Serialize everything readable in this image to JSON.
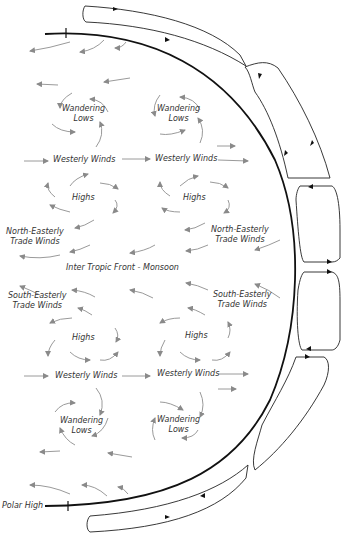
{
  "diagram": {
    "type": "global-atmospheric-circulation",
    "labels": {
      "wandering_lows_nw": "Wandering\nLows",
      "wandering_lows_ne": "Wandering\nLows",
      "westerly_winds_n1": "Westerly Winds",
      "westerly_winds_n2": "Westerly Winds",
      "highs_nw": "Highs",
      "highs_ne": "Highs",
      "ne_trade_winds_left": "North-Easterly\nTrade Winds",
      "ne_trade_winds_right": "North-Easterly\nTrade Winds",
      "itcz": "Inter Tropic Front - Monsoon",
      "se_trade_winds_left": "South-Easterly\nTrade Winds",
      "se_trade_winds_right": "South-Easterly\nTrade Winds",
      "highs_sw": "Highs",
      "highs_se": "Highs",
      "westerly_winds_s1": "Westerly Winds",
      "westerly_winds_s2": "Westerly Winds",
      "wandering_lows_sw": "Wandering\nLows",
      "wandering_lows_se": "Wandering\nLows",
      "polar_high": "Polar High"
    },
    "colors": {
      "earth_outline": "#111111",
      "cells": "#222222",
      "wind_arrows": "#9a9a9a",
      "text": "#333333"
    }
  }
}
